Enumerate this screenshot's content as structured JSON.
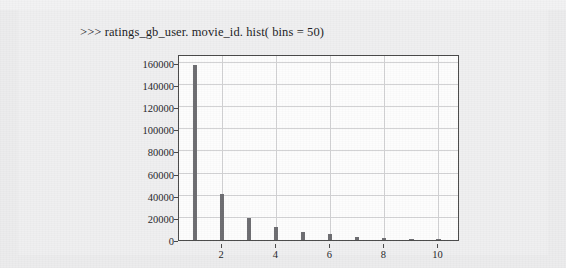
{
  "caption": ">>> ratings_gb_user. movie_id. hist( bins = 50)",
  "colors": {
    "page_background": "#ececed",
    "panel_background": "#efeff0",
    "plot_background": "#fdfdfd",
    "bar": "#6d6d71",
    "grid": "#d2d2d4",
    "axis": "#4a4a4a",
    "text": "#1d1d1f"
  },
  "chart_data": {
    "type": "bar",
    "title": "",
    "xlabel": "",
    "ylabel": "",
    "grid": true,
    "legend": false,
    "xlim": [
      0.4,
      10.8
    ],
    "ylim": [
      0,
      168000
    ],
    "xticks": [
      2,
      4,
      6,
      8,
      10
    ],
    "xtick_labels": [
      "2",
      "4",
      "6",
      "8",
      "10"
    ],
    "yticks": [
      0,
      20000,
      40000,
      60000,
      80000,
      100000,
      120000,
      140000,
      160000
    ],
    "ytick_labels": [
      "0",
      "20000",
      "40000",
      "60000",
      "80000",
      "100000",
      "120000",
      "140000",
      "160000"
    ],
    "x": [
      1,
      2,
      3,
      4,
      5,
      6,
      7,
      8,
      9,
      10
    ],
    "categories": [
      "1",
      "2",
      "3",
      "4",
      "5",
      "6",
      "7",
      "8",
      "9",
      "10"
    ],
    "values": [
      158000,
      42000,
      20000,
      12000,
      7000,
      5000,
      3000,
      2000,
      1200,
      800
    ],
    "bar_width": 0.16
  }
}
